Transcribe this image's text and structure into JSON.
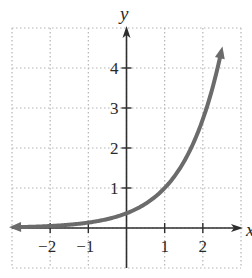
{
  "chart_data": {
    "type": "line",
    "title": "",
    "xlabel": "x",
    "ylabel": "y",
    "xlim": [
      -3,
      3
    ],
    "ylim": [
      -1,
      5
    ],
    "grid": true,
    "grid_style": "dotted",
    "x_ticks": [
      -2,
      -1,
      1,
      2
    ],
    "y_ticks": [
      1,
      2,
      3,
      4
    ],
    "x_tick_labels": [
      "−2",
      "−1",
      "1",
      "2"
    ],
    "y_tick_labels": [
      "1",
      "2",
      "3",
      "4"
    ],
    "legend": null,
    "series": [
      {
        "name": "exponential curve",
        "function": "y = e^(x-1)",
        "color": "#6b6b6b",
        "arrows": "both ends",
        "x": [
          -3,
          -2,
          -1,
          0,
          1,
          1.5,
          2,
          2.5
        ],
        "y": [
          0.02,
          0.05,
          0.14,
          0.37,
          1.0,
          1.65,
          2.72,
          4.48
        ]
      }
    ]
  },
  "colors": {
    "axis": "#2e2e2e",
    "grid": "#b5b5b5",
    "curve": "#6b6b6b",
    "background": "#ffffff"
  }
}
